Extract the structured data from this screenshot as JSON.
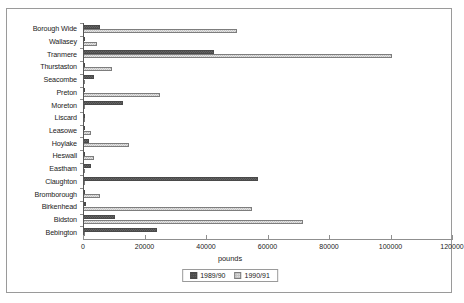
{
  "chart_data": {
    "type": "bar",
    "orientation": "horizontal",
    "grouping": "grouped",
    "title": "",
    "xlabel": "pounds",
    "ylabel": "",
    "xlim": [
      0,
      120000
    ],
    "xticks": [
      0,
      20000,
      40000,
      60000,
      80000,
      100000,
      120000
    ],
    "xtick_labels": [
      "0",
      "20000",
      "40000",
      "60000",
      "80000",
      "100000",
      "120000"
    ],
    "grid": false,
    "legend_position": "bottom-center",
    "categories": [
      "Borough Wide",
      "Wallasey",
      "Tranmere",
      "Thurstaston",
      "Seacombe",
      "Preton",
      "Moreton",
      "Liscard",
      "Leasowe",
      "Hoylake",
      "Heswall",
      "Eastham",
      "Claughton",
      "Bromborough",
      "Birkenhead",
      "Bidston",
      "Bebington"
    ],
    "series": [
      {
        "name": "1989/90",
        "color": "#4d4d4d",
        "values": [
          5500,
          300,
          42500,
          400,
          3500,
          300,
          13000,
          200,
          300,
          2000,
          300,
          2500,
          57000,
          400,
          1000,
          10500,
          24000
        ]
      },
      {
        "name": "1990/91",
        "color": "#c4c4c4",
        "values": [
          50000,
          4500,
          100500,
          9500,
          300,
          25000,
          400,
          300,
          2500,
          15000,
          3500,
          300,
          400,
          5500,
          55000,
          71500,
          400
        ]
      }
    ]
  },
  "legend": {
    "entries": [
      {
        "label": "1989/90",
        "swatch": "series-0-swatch"
      },
      {
        "label": "1990/91",
        "swatch": "series-1-swatch"
      }
    ]
  }
}
